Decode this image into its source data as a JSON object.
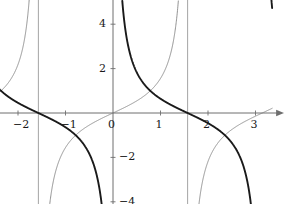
{
  "chart_data": {
    "type": "line",
    "title": "",
    "xlabel": "x",
    "ylabel": "y",
    "xlim": [
      -3.35,
      3.35
    ],
    "ylim": [
      -5.1,
      5.1
    ],
    "grid": false,
    "legend": "none",
    "axis_style": "arrows-both-ends-right-top",
    "x_ticks": [
      -3,
      -2,
      -1,
      0,
      1,
      2,
      3
    ],
    "x_tick_labels": [
      "−3",
      "−2",
      "−1",
      "0",
      "1",
      "2",
      "3"
    ],
    "y_ticks": [
      -4,
      -2,
      2,
      4
    ],
    "y_tick_labels": [
      "−4",
      "−2",
      "2",
      "4"
    ],
    "asymptotes": {
      "style": "thin vertical gray lines",
      "x_values": [
        -1.5708,
        1.5708
      ],
      "labels": [
        "−π/2",
        "π/2"
      ],
      "color": "#9a9a9a"
    },
    "series": [
      {
        "name": "tan(x)",
        "function": "tan",
        "color": "#777777",
        "width": 0.8,
        "style": "thin",
        "zeros": [
          -3.1416,
          0,
          3.1416
        ],
        "vertical_asymptotes": [
          -1.5708,
          1.5708
        ],
        "description": "increasing branches, thin gray curve"
      },
      {
        "name": "cot(x)",
        "function": "cot",
        "color": "#1a1a1a",
        "width": 1.9,
        "style": "thick",
        "zeros": [
          -1.5708,
          1.5708
        ],
        "vertical_asymptotes": [
          -3.1416,
          0,
          3.1416
        ],
        "description": "decreasing branches, thick black curve"
      }
    ],
    "intersections": [
      {
        "x": -2.3562,
        "y": 1.0
      },
      {
        "x": -0.7854,
        "y": -1.0
      },
      {
        "x": 0.7854,
        "y": 1.0
      },
      {
        "x": 2.3562,
        "y": -1.0
      }
    ]
  },
  "axes": {
    "x_label": "x",
    "y_label": "y"
  },
  "colors": {
    "axis": "#6e6e6e",
    "asymptote": "#9a9a9a",
    "tan_curve": "#777777",
    "cot_curve": "#1a1a1a",
    "text": "#1a1a1a",
    "background": "#ffffff"
  }
}
